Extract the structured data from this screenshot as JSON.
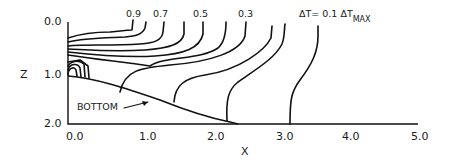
{
  "figure": {
    "type": "contour-diagram",
    "xaxis": {
      "label": "X",
      "ticks": [
        "0.0",
        "1.0",
        "2.0",
        "3.0",
        "4.0",
        "5.0"
      ],
      "range": [
        0.0,
        5.0
      ]
    },
    "zaxis": {
      "label": "Z",
      "ticks": [
        "0.0",
        "1.0",
        "2.0"
      ],
      "range": [
        0.0,
        2.0
      ],
      "inverted": true
    },
    "contour_labels": [
      "0.9",
      "0.7",
      "0.5",
      "0.3"
    ],
    "delta_label": {
      "main": "ΔT= 0.1 ΔT",
      "subscript": "MAX"
    },
    "bottom_label": "BOTTOM",
    "contour_levels": [
      0.9,
      0.8,
      0.7,
      0.6,
      0.5,
      0.4,
      0.3,
      0.2,
      0.1
    ]
  }
}
